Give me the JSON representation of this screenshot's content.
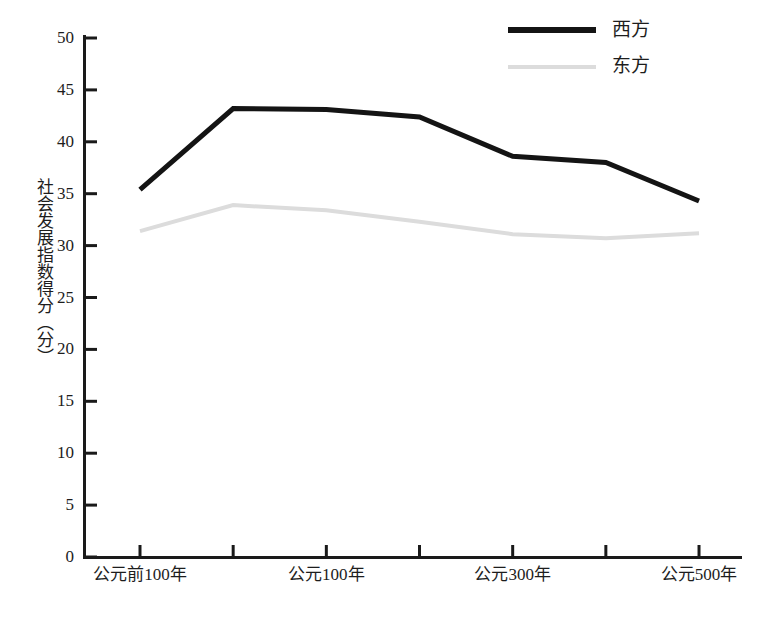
{
  "chart_data": {
    "type": "line",
    "title": "",
    "subtitle": "",
    "xlabel": "",
    "ylabel": "社会发展指数得分（分）",
    "ylim": [
      0,
      50
    ],
    "y_ticks": [
      0,
      5,
      10,
      15,
      20,
      25,
      30,
      35,
      40,
      45,
      50
    ],
    "y_tick_labels": [
      "0",
      "5",
      "10",
      "15",
      "20",
      "25",
      "30",
      "35",
      "40",
      "45",
      "50"
    ],
    "grid": false,
    "legend_position": "top-right",
    "x": [
      -100,
      0,
      100,
      200,
      300,
      400,
      500
    ],
    "categories": [
      "公元前100年",
      "公元1年",
      "公元100年",
      "公元200年",
      "公元300年",
      "公元400年",
      "公元500年"
    ],
    "x_tick_labels": [
      "公元前100年",
      "公元100年",
      "公元300年",
      "公元500年"
    ],
    "x_tick_label_positions": [
      0,
      2,
      4,
      6
    ],
    "series": [
      {
        "name": "西方",
        "color": "#141414",
        "width": 5,
        "values": [
          35.4,
          43.2,
          43.1,
          42.4,
          38.6,
          38.0,
          34.3
        ]
      },
      {
        "name": "东方",
        "color": "#dcdcdc",
        "width": 4,
        "values": [
          31.4,
          33.9,
          33.4,
          32.3,
          31.1,
          30.7,
          31.2
        ]
      }
    ]
  },
  "axis": {
    "y_title": "社会发展指数得分（分）",
    "y_labels": [
      "50",
      "45",
      "40",
      "35",
      "30",
      "25",
      "20",
      "15",
      "10",
      "5",
      "0"
    ],
    "x_labels": [
      "公元前100年",
      "公元100年",
      "公元300年",
      "公元500年"
    ]
  },
  "legend": {
    "items": [
      {
        "label": "西方",
        "color": "#141414"
      },
      {
        "label": "东方",
        "color": "#dcdcdc"
      }
    ]
  },
  "colors": {
    "background": "#ffffff",
    "axis": "#1a1a1a",
    "west_line": "#141414",
    "east_line": "#dcdcdc",
    "text": "#1d1d1d"
  }
}
